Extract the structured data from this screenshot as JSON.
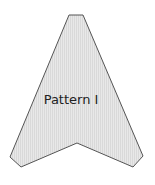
{
  "diagram": {
    "shape": {
      "type": "arrowhead-polygon",
      "label": "Pattern I",
      "fill_colors": [
        "#d9d9d9",
        "#e8e8e8"
      ],
      "stroke": "#555555",
      "points": "69,15 83,15 143,156 133,167 77,143 21,167 10,157"
    }
  }
}
